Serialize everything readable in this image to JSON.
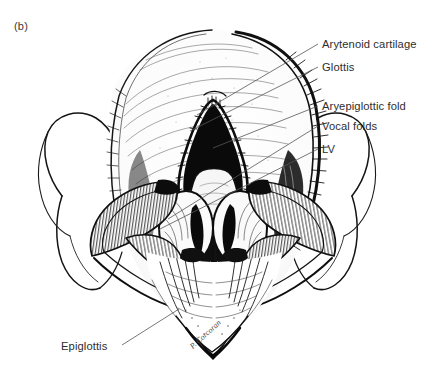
{
  "figure": {
    "panel_label": "(b)",
    "signature": "P. Corcoran",
    "background_color": "#ffffff",
    "ink_color": "#111111",
    "leader_color": "#555555",
    "text_color": "#2e2e2e",
    "labels": [
      {
        "text": "Arytenoid cartilage",
        "leader_from_x": 318,
        "leader_from_y": 44,
        "leader_to_x": 197,
        "leader_to_y": 115
      },
      {
        "text": "Glottis",
        "leader_from_x": 318,
        "leader_from_y": 67,
        "leader_to_x": 190,
        "leader_to_y": 131
      },
      {
        "text": "Aryepiglottic fold",
        "leader_from_x": 318,
        "leader_from_y": 106,
        "leader_to_x": 213,
        "leader_to_y": 148
      },
      {
        "text": "Vocal folds",
        "leader_from_x": 318,
        "leader_from_y": 126,
        "leader_to_x": 168,
        "leader_to_y": 219
      },
      {
        "text": "LV",
        "leader_from_x": 318,
        "leader_from_y": 149,
        "leader_to_x": 158,
        "leader_to_y": 230
      },
      {
        "text": "Epiglottis",
        "leader_from_x": 122,
        "leader_from_y": 345,
        "leader_to_x": 179,
        "leader_to_y": 309
      }
    ]
  }
}
